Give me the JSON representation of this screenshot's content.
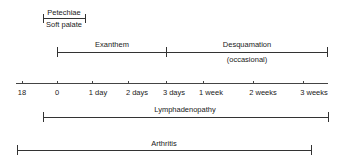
{
  "diagram": {
    "type": "timeline",
    "axis": {
      "y": 83,
      "x_start": 16,
      "x_end": 328,
      "ticks": [
        {
          "label": "18",
          "x": 22
        },
        {
          "label": "0",
          "x": 57
        },
        {
          "label": "1 day",
          "x": 92
        },
        {
          "label": "2 days",
          "x": 128
        },
        {
          "label": "3 days",
          "x": 166
        },
        {
          "label": "1 week",
          "x": 203
        },
        {
          "label": "2 weeks",
          "x": 253
        },
        {
          "label": "3 weeks",
          "x": 303
        }
      ]
    },
    "bars": [
      {
        "name": "petechiae",
        "label_above": "Petechiae",
        "label_below": "Soft palate",
        "x_start": 43,
        "x_end": 85,
        "y": 18
      },
      {
        "name": "exanthem",
        "label_above": "Exanthem",
        "x_start": 57,
        "x_end": 166,
        "y": 52
      },
      {
        "name": "desquamation",
        "label_above": "Desquamation",
        "label_below": "(occasional)",
        "x_start": 166,
        "x_end": 327,
        "y": 52
      },
      {
        "name": "lymphadenopathy",
        "label_above": "Lymphadenopathy",
        "x_start": 43,
        "x_end": 328,
        "y": 117
      },
      {
        "name": "arthritis",
        "label_above": "Arthritis",
        "x_start": 17,
        "x_end": 311,
        "y": 150
      }
    ]
  }
}
